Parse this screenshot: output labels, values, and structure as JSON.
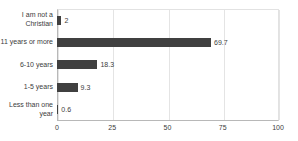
{
  "chart_data": {
    "type": "bar",
    "orientation": "horizontal",
    "title": "",
    "xlabel": "",
    "ylabel": "",
    "categories": [
      "I am not a Christian",
      "11 years or more",
      "6-10 years",
      "1-5 years",
      "Less than one year"
    ],
    "values": [
      2,
      69.7,
      18.3,
      9.3,
      0.6
    ],
    "data_labels": [
      "2",
      "69.7",
      "18.3",
      "9.3",
      "0.6"
    ],
    "xlim": [
      0,
      100
    ],
    "xticks": [
      0,
      25,
      50,
      75,
      100
    ],
    "xtick_labels": [
      "0",
      "25",
      "50",
      "75",
      "100"
    ],
    "grid": true,
    "grid_axis": "x",
    "legend": false,
    "bar_color": "#404040",
    "gridline_color": "#e4e4e4",
    "axis_color": "#b8b8b8",
    "text_color": "#3c3c3c",
    "background": "#ffffff"
  }
}
